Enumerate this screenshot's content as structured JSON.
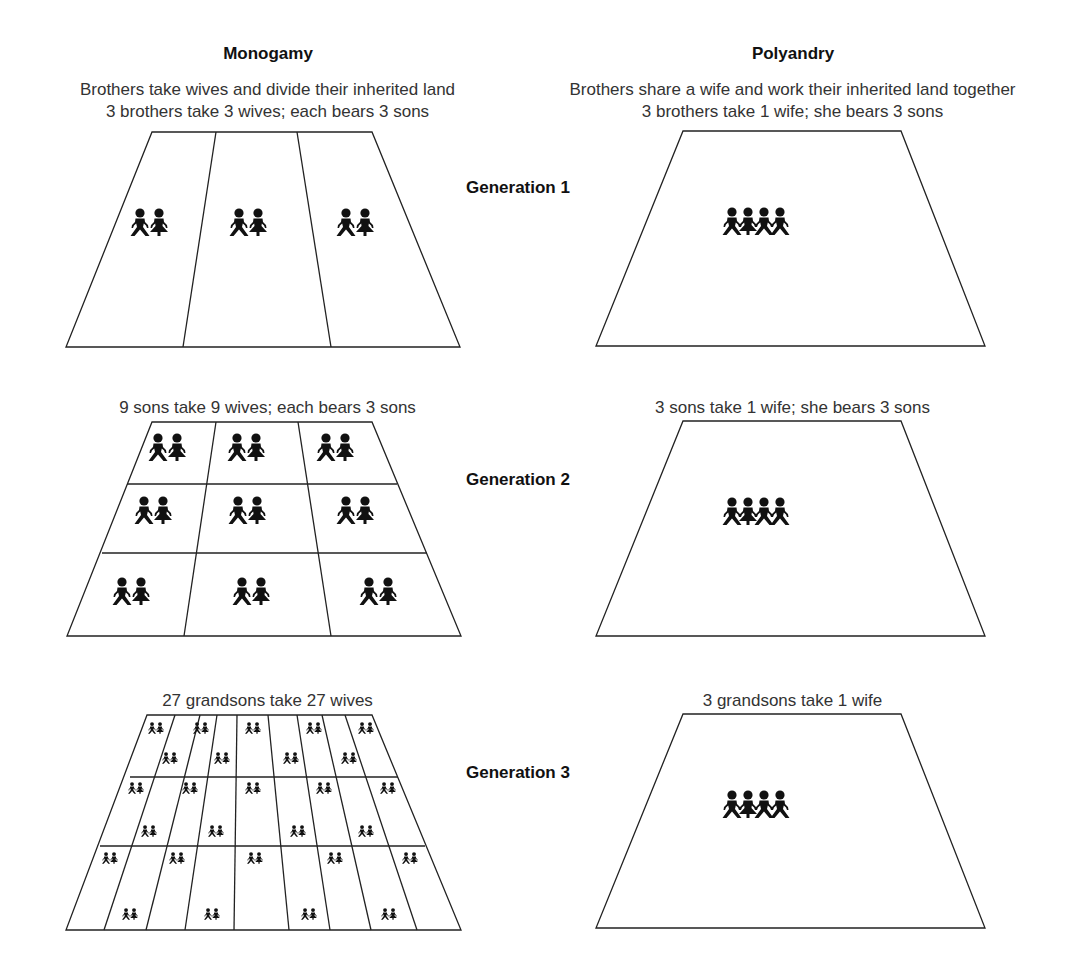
{
  "columns": {
    "monogamy": {
      "title": "Monogamy",
      "description": "Brothers take wives and divide their inherited land",
      "generation_captions": [
        "3 brothers take 3 wives; each bears 3 sons",
        "9 sons take 9 wives; each bears 3 sons",
        "27 grandsons take 27 wives"
      ],
      "plots_per_generation": [
        3,
        9,
        27
      ],
      "couples_per_generation": [
        3,
        9,
        27
      ]
    },
    "polyandry": {
      "title": "Polyandry",
      "description": "Brothers share a wife and work their inherited land together",
      "generation_captions": [
        "3 brothers take 1 wife; she bears 3 sons",
        "3 sons take 1 wife; she bears 3 sons",
        "3 grandsons take 1 wife"
      ],
      "plots_per_generation": [
        1,
        1,
        1
      ],
      "household_figures": [
        "male-figure",
        "female-figure",
        "male-figure",
        "male-figure"
      ]
    }
  },
  "generations": [
    {
      "label": "Generation 1"
    },
    {
      "label": "Generation 2"
    },
    {
      "label": "Generation 3"
    }
  ],
  "icons": {
    "male": "male-figure-icon",
    "female": "female-figure-icon"
  },
  "colors": {
    "ink": "#111111",
    "text": "#333333",
    "background": "#ffffff"
  }
}
